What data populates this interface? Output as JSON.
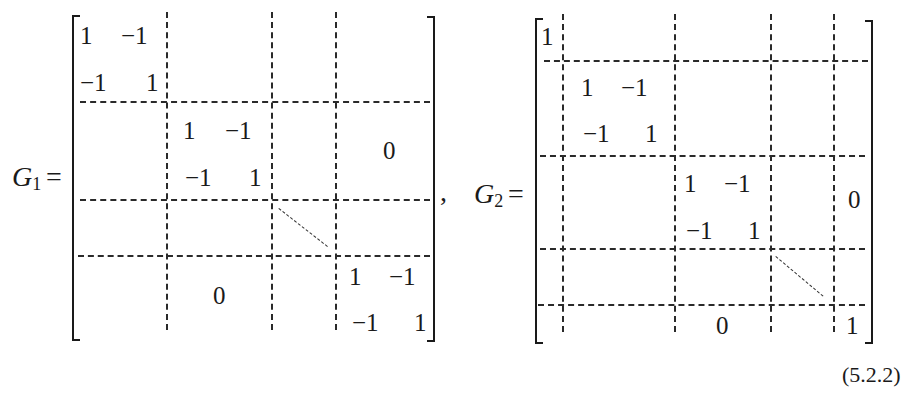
{
  "equation_number": "(5.2.2)",
  "separator": ",",
  "matrices": [
    {
      "label_base": "G",
      "label_sub": "1",
      "equals": "=",
      "block_11": {
        "a": "1",
        "b": "−1",
        "c": "−1",
        "d": "1"
      },
      "block_22": {
        "a": "1",
        "b": "−1",
        "c": "−1",
        "d": "1"
      },
      "block_nn": {
        "a": "1",
        "b": "−1",
        "c": "−1",
        "d": "1"
      },
      "upper_zero": "0",
      "lower_zero": "0"
    },
    {
      "label_base": "G",
      "label_sub": "2",
      "equals": "=",
      "top_left": "1",
      "block_11": {
        "a": "1",
        "b": "−1",
        "c": "−1",
        "d": "1"
      },
      "block_22": {
        "a": "1",
        "b": "−1",
        "c": "−1",
        "d": "1"
      },
      "upper_zero": "0",
      "lower_zero": "0",
      "bottom_right": "1"
    }
  ]
}
